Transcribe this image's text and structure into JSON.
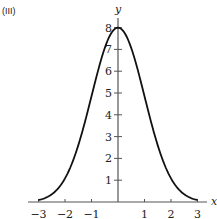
{
  "panel_label": "(III)",
  "chart_data": {
    "type": "line",
    "title": "",
    "panel": "(III)",
    "xlabel": "x",
    "ylabel": "y",
    "xlim": [
      -3.3,
      3.3
    ],
    "ylim": [
      0,
      8.4
    ],
    "x_ticks": [
      -3,
      -2,
      -1,
      1,
      2,
      3
    ],
    "y_ticks": [
      1,
      2,
      3,
      4,
      5,
      6,
      7,
      8
    ],
    "grid": false,
    "legend": null,
    "series": [
      {
        "name": "y = 8e^(-x^2/2)",
        "x": [
          -3,
          -2.75,
          -2.5,
          -2.25,
          -2,
          -1.75,
          -1.5,
          -1.25,
          -1,
          -0.75,
          -0.5,
          -0.25,
          0,
          0.25,
          0.5,
          0.75,
          1,
          1.25,
          1.5,
          1.75,
          2,
          2.25,
          2.5,
          2.75,
          3
        ],
        "y": [
          0.09,
          0.18,
          0.35,
          0.64,
          1.08,
          1.73,
          2.6,
          3.66,
          4.85,
          6.03,
          7.06,
          7.75,
          8.0,
          7.75,
          7.06,
          6.03,
          4.85,
          3.66,
          2.6,
          1.73,
          1.08,
          0.64,
          0.35,
          0.18,
          0.09
        ]
      }
    ]
  },
  "axes": {
    "x_label": "x",
    "y_label": "y",
    "x_tick_labels": [
      "−3",
      "−2",
      "−1",
      "1",
      "2",
      "3"
    ],
    "y_tick_labels": [
      "1",
      "2",
      "3",
      "4",
      "5",
      "6",
      "7",
      "8"
    ]
  }
}
